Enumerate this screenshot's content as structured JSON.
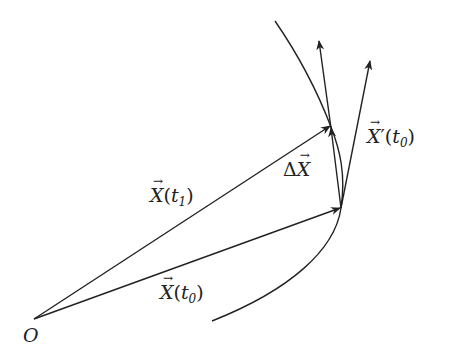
{
  "diagram": {
    "origin_label": "O",
    "labels": {
      "x_t1": {
        "base": "X",
        "open": "(",
        "var": "t",
        "sub": "1",
        "close": ")"
      },
      "x_t0": {
        "base": "X",
        "open": "(",
        "var": "t",
        "sub": "0",
        "close": ")"
      },
      "delta_x": {
        "delta": "Δ",
        "base": "X"
      },
      "x_prime_t0": {
        "base": "X",
        "prime": "′",
        "open": "(",
        "var": "t",
        "sub": "0",
        "close": ")"
      }
    },
    "colors": {
      "stroke": "#222222",
      "background": "#ffffff"
    }
  }
}
